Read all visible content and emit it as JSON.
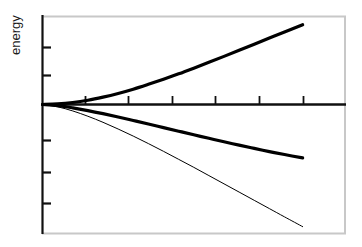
{
  "figure": {
    "background_color": "#ffffff",
    "frame_color": "#c8c8c8",
    "axis_color": "#101010",
    "curve_color": "#000000"
  },
  "axes": {
    "ylabel": "energy",
    "xlabel": "",
    "title": ""
  },
  "chart_data": {
    "type": "line",
    "title": "",
    "subtitle": "",
    "xlabel": "",
    "ylabel": "energy",
    "xlim": [
      0,
      1
    ],
    "ylim": [
      -1,
      0.62
    ],
    "grid": false,
    "legend": "none",
    "x_tick_labels": [],
    "y_tick_labels": [],
    "x_ticks": [
      0.142,
      0.283,
      0.427,
      0.569,
      0.716,
      0.858
    ],
    "y_ticks": [
      -0.8,
      -0.54,
      -0.25,
      0.0,
      0.24,
      0.45
    ],
    "zero_line": 0.0,
    "annotations": [],
    "series": [
      {
        "name": "upper-branch",
        "style": "thick-solid",
        "linewidth": 3.2,
        "color": "#000000",
        "x": [
          0.0,
          0.05,
          0.1,
          0.15,
          0.2,
          0.25,
          0.3,
          0.35,
          0.4,
          0.45,
          0.5,
          0.55,
          0.6,
          0.65,
          0.7,
          0.75,
          0.8,
          0.86
        ],
        "y": [
          0.0,
          0.004,
          0.014,
          0.03,
          0.052,
          0.078,
          0.108,
          0.142,
          0.178,
          0.216,
          0.256,
          0.297,
          0.339,
          0.382,
          0.425,
          0.468,
          0.51,
          0.562
        ]
      },
      {
        "name": "middle-branch",
        "style": "thick-solid",
        "linewidth": 3.2,
        "color": "#000000",
        "x": [
          0.0,
          0.05,
          0.1,
          0.15,
          0.2,
          0.25,
          0.3,
          0.35,
          0.4,
          0.45,
          0.5,
          0.55,
          0.6,
          0.65,
          0.7,
          0.75,
          0.8,
          0.86
        ],
        "y": [
          0.0,
          -0.009,
          -0.026,
          -0.047,
          -0.071,
          -0.097,
          -0.124,
          -0.151,
          -0.179,
          -0.207,
          -0.235,
          -0.262,
          -0.289,
          -0.315,
          -0.34,
          -0.365,
          -0.388,
          -0.414
        ]
      },
      {
        "name": "lower-branch",
        "style": "thin-solid",
        "linewidth": 1.0,
        "color": "#000000",
        "x": [
          0.0,
          0.05,
          0.1,
          0.15,
          0.2,
          0.25,
          0.3,
          0.35,
          0.4,
          0.45,
          0.5,
          0.55,
          0.6,
          0.65,
          0.7,
          0.75,
          0.8,
          0.86
        ],
        "y": [
          0.0,
          -0.018,
          -0.05,
          -0.091,
          -0.138,
          -0.19,
          -0.245,
          -0.303,
          -0.363,
          -0.425,
          -0.487,
          -0.551,
          -0.615,
          -0.679,
          -0.743,
          -0.807,
          -0.871,
          -0.947
        ]
      }
    ]
  }
}
